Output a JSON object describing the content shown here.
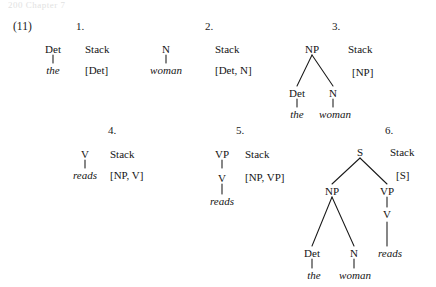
{
  "figure": {
    "cut_header": "200      Chapter 7",
    "example_number": "(11)",
    "stack_label": "Stack"
  },
  "steps": [
    {
      "number": "1.",
      "nodes": [
        "Det"
      ],
      "leaves": [
        "the"
      ],
      "stack": "[Det]"
    },
    {
      "number": "2.",
      "nodes": [
        "N"
      ],
      "leaves": [
        "woman"
      ],
      "stack": "[Det, N]"
    },
    {
      "number": "3.",
      "nodes": [
        "NP",
        "Det",
        "N"
      ],
      "leaves": [
        "the",
        "woman"
      ],
      "stack": "[NP]"
    },
    {
      "number": "4.",
      "nodes": [
        "V"
      ],
      "leaves": [
        "reads"
      ],
      "stack": "[NP, V]"
    },
    {
      "number": "5.",
      "nodes": [
        "VP",
        "V"
      ],
      "leaves": [
        "reads"
      ],
      "stack": "[NP, VP]"
    },
    {
      "number": "6.",
      "nodes": [
        "S",
        "NP",
        "VP",
        "Det",
        "N",
        "V"
      ],
      "leaves": [
        "the",
        "woman",
        "reads"
      ],
      "stack": "[S]"
    }
  ],
  "tree1": {
    "root": "Det",
    "leaf": "the",
    "stack_head": "Stack",
    "stack_value": "[Det]",
    "number": "1."
  },
  "tree2": {
    "root": "N",
    "leaf": "woman",
    "stack_head": "Stack",
    "stack_value": "[Det, N]",
    "number": "2."
  },
  "tree3": {
    "root": "NP",
    "left": "Det",
    "right": "N",
    "left_leaf": "the",
    "right_leaf": "woman",
    "stack_head": "Stack",
    "stack_value": "[NP]",
    "number": "3."
  },
  "tree4": {
    "root": "V",
    "leaf": "reads",
    "stack_head": "Stack",
    "stack_value": "[NP, V]",
    "number": "4."
  },
  "tree5": {
    "root": "VP",
    "mid": "V",
    "leaf": "reads",
    "stack_head": "Stack",
    "stack_value": "[NP, VP]",
    "number": "5."
  },
  "tree6": {
    "root": "S",
    "np": "NP",
    "vp": "VP",
    "det": "Det",
    "n": "N",
    "v": "V",
    "det_leaf": "the",
    "n_leaf": "woman",
    "v_leaf": "reads",
    "stack_head": "Stack",
    "stack_value": "[S]",
    "number": "6."
  }
}
